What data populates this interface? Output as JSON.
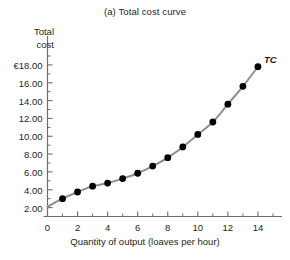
{
  "chart_data": {
    "type": "line",
    "title": "(a) Total cost curve",
    "xlabel": "Quantity of output (loaves per hour)",
    "ylabel": "Total\ncost",
    "ylabel_lines": [
      "Total",
      "cost"
    ],
    "series": [
      {
        "name": "TC",
        "label": "TC",
        "color": "#8e8e8e",
        "marker_color": "#000000",
        "x": [
          0,
          1,
          2,
          3,
          4,
          5,
          6,
          7,
          8,
          9,
          10,
          11,
          12,
          13,
          14
        ],
        "values": [
          2.1,
          3.0,
          3.75,
          4.4,
          4.75,
          5.25,
          5.85,
          6.65,
          7.6,
          8.8,
          10.2,
          11.6,
          13.6,
          15.6,
          17.8
        ],
        "marker_x": [
          1,
          2,
          3,
          4,
          5,
          6,
          7,
          8,
          9,
          10,
          11,
          12,
          13,
          14
        ]
      }
    ],
    "x_ticks_major": [
      0,
      2,
      4,
      6,
      8,
      10,
      12,
      14
    ],
    "x_tick_labels": [
      "0",
      "2",
      "4",
      "6",
      "8",
      "10",
      "12",
      "14"
    ],
    "x_ticks_minor": [
      1,
      3,
      5,
      7,
      9,
      11,
      13,
      15
    ],
    "y_ticks_major": [
      2,
      4,
      6,
      8,
      10,
      12,
      14,
      16,
      18
    ],
    "y_tick_labels": [
      "2.00",
      "4.00",
      "6.00",
      "8.00",
      "10.00",
      "12.00",
      "14.00",
      "16.00",
      "€18.00"
    ],
    "y_ticks_minor": [
      1,
      3,
      5,
      7,
      9,
      11,
      13,
      15,
      17,
      19
    ],
    "xlim": [
      0,
      15.6
    ],
    "ylim": [
      1.0,
      19.0
    ],
    "grid": false,
    "legend_position": "inline-right-end",
    "currency_symbol": "€",
    "axis_color": "#6d6e71",
    "background": "#ffffff"
  }
}
